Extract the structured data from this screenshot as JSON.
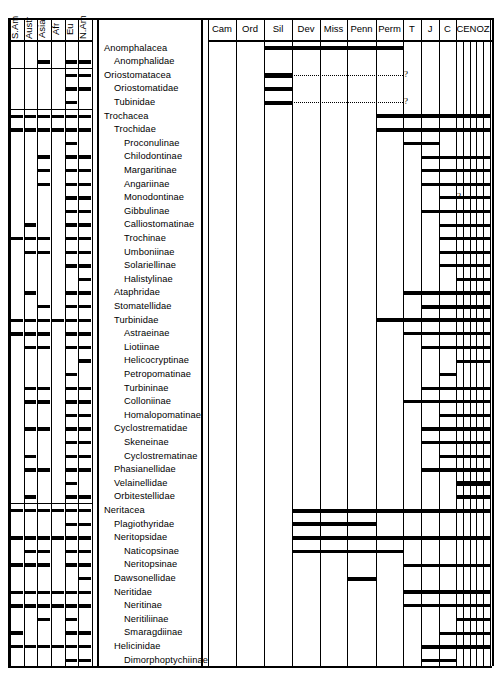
{
  "figure": {
    "type": "stratigraphic-range-chart",
    "region_columns": [
      "S.Am",
      "Austr",
      "Asia",
      "Afr",
      "Eu",
      "N.Am"
    ],
    "period_columns": [
      "Cam",
      "Ord",
      "Sil",
      "Dev",
      "Miss",
      "Penn",
      "Perm",
      "T",
      "J",
      "C",
      "CENOZ"
    ],
    "cenoz_subdivisions": 5
  },
  "chart_data": {
    "type": "table",
    "title": "",
    "xlabel": "",
    "ylabel": "",
    "grid": true,
    "legend": "none",
    "x_categories": [
      "Cam",
      "Ord",
      "Sil",
      "Dev",
      "Miss",
      "Penn",
      "Perm",
      "T",
      "J",
      "C",
      "CENOZ"
    ],
    "region_categories": [
      "S.Am",
      "Austr",
      "Asia",
      "Afr",
      "Eu",
      "N.Am"
    ],
    "rows": [
      {
        "name": "Anomphalacea",
        "indent": 0,
        "regions": [],
        "bar": {
          "start": "Sil",
          "end": "Perm"
        },
        "dotted": null,
        "query": false
      },
      {
        "name": "Anomphalidae",
        "indent": 1,
        "regions": [
          "Asia",
          "Eu",
          "N.Am"
        ],
        "bar": null,
        "dotted": null,
        "query": false
      },
      {
        "name": "Oriostomatacea",
        "indent": 0,
        "regions": [
          "Eu",
          "N.Am"
        ],
        "bar": {
          "start": "Sil",
          "end": "Sil"
        },
        "dotted": {
          "start": "Sil",
          "end": "Perm"
        },
        "query": true
      },
      {
        "name": "Oriostomatidae",
        "indent": 1,
        "regions": [
          "Eu",
          "N.Am"
        ],
        "bar": {
          "start": "Sil",
          "end": "Sil"
        },
        "dotted": null,
        "query": false
      },
      {
        "name": "Tubinidae",
        "indent": 1,
        "regions": [
          "Eu"
        ],
        "bar": {
          "start": "Sil",
          "end": "Sil"
        },
        "dotted": {
          "start": "Sil",
          "end": "Perm"
        },
        "query": true
      },
      {
        "name": "Trochacea",
        "indent": 0,
        "regions": [
          "S.Am",
          "Austr",
          "Asia",
          "Afr",
          "Eu",
          "N.Am"
        ],
        "bar": {
          "start": "Perm",
          "end": "CENOZ"
        },
        "dotted": null,
        "query": false
      },
      {
        "name": "Trochidae",
        "indent": 1,
        "regions": [
          "S.Am",
          "Austr",
          "Asia",
          "Afr",
          "Eu",
          "N.Am"
        ],
        "bar": {
          "start": "Perm",
          "end": "CENOZ"
        },
        "dotted": null,
        "query": false
      },
      {
        "name": "Proconulinae",
        "indent": 2,
        "regions": [
          "Eu"
        ],
        "bar": {
          "start": "T",
          "end": "J"
        },
        "dotted": null,
        "query": false
      },
      {
        "name": "Chilodontinae",
        "indent": 2,
        "regions": [
          "Asia",
          "Eu",
          "N.Am"
        ],
        "bar": {
          "start": "J",
          "end": "CENOZ"
        },
        "dotted": null,
        "query": false
      },
      {
        "name": "Margaritinae",
        "indent": 2,
        "regions": [
          "Asia",
          "Eu",
          "N.Am"
        ],
        "bar": {
          "start": "J",
          "end": "CENOZ"
        },
        "dotted": null,
        "query": false
      },
      {
        "name": "Angariinae",
        "indent": 2,
        "regions": [
          "Asia",
          "Eu",
          "N.Am"
        ],
        "bar": {
          "start": "J",
          "end": "CENOZ"
        },
        "dotted": null,
        "query": false
      },
      {
        "name": "Monodontinae",
        "indent": 2,
        "regions": [
          "Eu",
          "N.Am"
        ],
        "bar": {
          "start": "C",
          "end": "CENOZ"
        },
        "dotted": {
          "start": "J",
          "end": "C"
        },
        "query": true
      },
      {
        "name": "Gibbulinae",
        "indent": 2,
        "regions": [
          "Eu",
          "N.Am"
        ],
        "bar": {
          "start": "J",
          "end": "CENOZ"
        },
        "dotted": null,
        "query": false
      },
      {
        "name": "Calliostomatinae",
        "indent": 2,
        "regions": [
          "Austr",
          "Eu",
          "N.Am"
        ],
        "bar": {
          "start": "C",
          "end": "CENOZ"
        },
        "dotted": null,
        "query": false
      },
      {
        "name": "Trochinae",
        "indent": 2,
        "regions": [
          "S.Am",
          "Austr",
          "Asia",
          "Eu",
          "N.Am"
        ],
        "bar": {
          "start": "C",
          "end": "CENOZ"
        },
        "dotted": null,
        "query": false
      },
      {
        "name": "Umboniinae",
        "indent": 2,
        "regions": [
          "Austr",
          "Asia",
          "Eu",
          "N.Am"
        ],
        "bar": {
          "start": "C",
          "end": "CENOZ"
        },
        "dotted": null,
        "query": false
      },
      {
        "name": "Solariellinae",
        "indent": 2,
        "regions": [
          "Eu",
          "N.Am"
        ],
        "bar": {
          "start": "C",
          "end": "CENOZ"
        },
        "dotted": null,
        "query": false
      },
      {
        "name": "Halistylinae",
        "indent": 2,
        "regions": [
          "N.Am"
        ],
        "bar": {
          "start": "CENOZ",
          "end": "CENOZ"
        },
        "dotted": {
          "start": "C",
          "end": "CENOZ"
        },
        "query": false
      },
      {
        "name": "Ataphridae",
        "indent": 1,
        "regions": [
          "Austr",
          "Eu",
          "N.Am"
        ],
        "bar": {
          "start": "T",
          "end": "CENOZ"
        },
        "dotted": null,
        "query": false
      },
      {
        "name": "Stomatellidae",
        "indent": 1,
        "regions": [
          "Asia",
          "Eu",
          "N.Am"
        ],
        "bar": {
          "start": "J",
          "end": "CENOZ"
        },
        "dotted": null,
        "query": false
      },
      {
        "name": "Turbinidae",
        "indent": 1,
        "regions": [
          "S.Am",
          "Austr",
          "Asia",
          "Afr",
          "Eu",
          "N.Am"
        ],
        "bar": {
          "start": "Perm",
          "end": "CENOZ"
        },
        "dotted": null,
        "query": false
      },
      {
        "name": "Astraeinae",
        "indent": 2,
        "regions": [
          "S.Am",
          "Austr",
          "Asia",
          "Eu",
          "N.Am"
        ],
        "bar": {
          "start": "T",
          "end": "CENOZ"
        },
        "dotted": null,
        "query": false
      },
      {
        "name": "Liotiinae",
        "indent": 2,
        "regions": [
          "Austr",
          "Asia",
          "Eu",
          "N.Am"
        ],
        "bar": {
          "start": "J",
          "end": "CENOZ"
        },
        "dotted": null,
        "query": false
      },
      {
        "name": "Helicocryptinae",
        "indent": 2,
        "regions": [
          "N.Am"
        ],
        "bar": {
          "start": "CENOZ",
          "end": "CENOZ"
        },
        "dotted": null,
        "query": false
      },
      {
        "name": "Petropomatinae",
        "indent": 2,
        "regions": [
          "Eu"
        ],
        "bar": {
          "start": "C",
          "end": "C"
        },
        "dotted": null,
        "query": false
      },
      {
        "name": "Turbininae",
        "indent": 2,
        "regions": [
          "Austr",
          "Asia",
          "Eu",
          "N.Am"
        ],
        "bar": {
          "start": "J",
          "end": "CENOZ"
        },
        "dotted": null,
        "query": false
      },
      {
        "name": "Colloniinae",
        "indent": 2,
        "regions": [
          "Austr",
          "Asia",
          "Eu",
          "N.Am"
        ],
        "bar": {
          "start": "T",
          "end": "CENOZ"
        },
        "dotted": null,
        "query": false
      },
      {
        "name": "Homalopomatinae",
        "indent": 2,
        "regions": [
          "Eu",
          "N.Am"
        ],
        "bar": {
          "start": "C",
          "end": "CENOZ"
        },
        "dotted": null,
        "query": false
      },
      {
        "name": "Cyclostrematidae",
        "indent": 1,
        "regions": [
          "Austr",
          "Asia",
          "Eu",
          "N.Am"
        ],
        "bar": {
          "start": "J",
          "end": "CENOZ"
        },
        "dotted": null,
        "query": false
      },
      {
        "name": "Skeneinae",
        "indent": 2,
        "regions": [
          "Eu",
          "N.Am"
        ],
        "bar": {
          "start": "J",
          "end": "CENOZ"
        },
        "dotted": null,
        "query": false
      },
      {
        "name": "Cyclostrematinae",
        "indent": 2,
        "regions": [
          "Austr",
          "Eu",
          "N.Am"
        ],
        "bar": {
          "start": "C",
          "end": "CENOZ"
        },
        "dotted": null,
        "query": false
      },
      {
        "name": "Phasianellidae",
        "indent": 1,
        "regions": [
          "Austr",
          "Asia",
          "Eu",
          "N.Am"
        ],
        "bar": {
          "start": "J",
          "end": "CENOZ"
        },
        "dotted": null,
        "query": false
      },
      {
        "name": "Velainellidae",
        "indent": 1,
        "regions": [
          "Eu"
        ],
        "bar": {
          "start": "CENOZ",
          "end": "CENOZ"
        },
        "dotted": null,
        "query": false
      },
      {
        "name": "Orbitestellidae",
        "indent": 1,
        "regions": [
          "Austr",
          "Eu",
          "N.Am"
        ],
        "bar": {
          "start": "CENOZ",
          "end": "CENOZ"
        },
        "dotted": null,
        "query": false
      },
      {
        "name": "Neritacea",
        "indent": 0,
        "regions": [
          "S.Am",
          "Austr",
          "Asia",
          "Afr",
          "Eu",
          "N.Am"
        ],
        "bar": {
          "start": "Dev",
          "end": "CENOZ"
        },
        "dotted": null,
        "query": false
      },
      {
        "name": "Plagiothyridae",
        "indent": 1,
        "regions": [
          "Eu",
          "N.Am"
        ],
        "bar": {
          "start": "Dev",
          "end": "Penn"
        },
        "dotted": null,
        "query": false
      },
      {
        "name": "Neritopsidae",
        "indent": 1,
        "regions": [
          "S.Am",
          "Austr",
          "Asia",
          "Afr",
          "Eu",
          "N.Am"
        ],
        "bar": {
          "start": "Dev",
          "end": "CENOZ"
        },
        "dotted": null,
        "query": false
      },
      {
        "name": "Naticopsinae",
        "indent": 2,
        "regions": [
          "Austr",
          "Asia",
          "Eu",
          "N.Am"
        ],
        "bar": {
          "start": "Dev",
          "end": "Perm"
        },
        "dotted": null,
        "query": false
      },
      {
        "name": "Neritopsinae",
        "indent": 2,
        "regions": [
          "S.Am",
          "Austr",
          "Asia",
          "Eu",
          "N.Am"
        ],
        "bar": {
          "start": "T",
          "end": "CENOZ"
        },
        "dotted": null,
        "query": false
      },
      {
        "name": "Dawsonellidae",
        "indent": 1,
        "regions": [
          "N.Am"
        ],
        "bar": {
          "start": "Penn",
          "end": "Penn"
        },
        "dotted": null,
        "query": false
      },
      {
        "name": "Neritidae",
        "indent": 1,
        "regions": [
          "S.Am",
          "Austr",
          "Asia",
          "Afr",
          "Eu",
          "N.Am"
        ],
        "bar": {
          "start": "T",
          "end": "CENOZ"
        },
        "dotted": null,
        "query": false
      },
      {
        "name": "Neritinae",
        "indent": 2,
        "regions": [
          "S.Am",
          "Austr",
          "Asia",
          "Afr",
          "Eu",
          "N.Am"
        ],
        "bar": {
          "start": "T",
          "end": "CENOZ"
        },
        "dotted": null,
        "query": false
      },
      {
        "name": "Neritiliinae",
        "indent": 2,
        "regions": [
          "Asia",
          "Eu"
        ],
        "bar": {
          "start": "CENOZ",
          "end": "CENOZ"
        },
        "dotted": null,
        "query": false
      },
      {
        "name": "Smaragdiinae",
        "indent": 2,
        "regions": [
          "S.Am",
          "Eu",
          "N.Am"
        ],
        "bar": {
          "start": "C",
          "end": "CENOZ"
        },
        "dotted": null,
        "query": false
      },
      {
        "name": "Helicinidae",
        "indent": 1,
        "regions": [
          "S.Am",
          "Austr",
          "Asia",
          "Afr",
          "Eu",
          "N.Am"
        ],
        "bar": {
          "start": "J",
          "end": "CENOZ"
        },
        "dotted": null,
        "query": false
      },
      {
        "name": "Dimorphoptychiinae",
        "indent": 2,
        "regions": [
          "Eu",
          "N.Am"
        ],
        "bar": {
          "start": "J",
          "end": "C"
        },
        "dotted": null,
        "query": false
      }
    ]
  },
  "colors": {
    "ink": "#000000",
    "paper": "#ffffff"
  },
  "annotations": {
    "query_symbol": "?"
  }
}
